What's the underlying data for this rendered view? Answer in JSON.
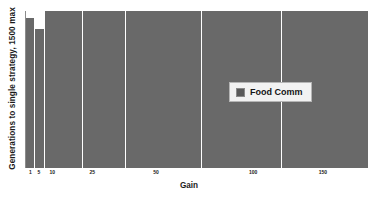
{
  "chart_data": {
    "type": "bar",
    "title": "",
    "xlabel": "Gain",
    "ylabel": "Generations to single strategy, 1500 max",
    "categories": [
      "1",
      "5",
      "10",
      "25",
      "50",
      "100",
      "150"
    ],
    "series": [
      {
        "name": "Food Comm",
        "values": [
          1440,
          1360,
          1500,
          1500,
          1500,
          1500,
          1500
        ]
      }
    ],
    "ylim": [
      0,
      1500
    ],
    "grid": false,
    "legend_position": "center-right",
    "bar_color": "#696969",
    "ticks": [
      {
        "label": "1",
        "x_frac": 0.013
      },
      {
        "label": "5",
        "x_frac": 0.038
      },
      {
        "label": "10",
        "x_frac": 0.077
      },
      {
        "label": "25",
        "x_frac": 0.194
      },
      {
        "label": "50",
        "x_frac": 0.38
      },
      {
        "label": "100",
        "x_frac": 0.664
      },
      {
        "label": "150",
        "x_frac": 0.868
      }
    ],
    "bars": [
      {
        "category": "1",
        "left_frac": 0.0,
        "width_frac": 0.022,
        "height_frac": 0.955
      },
      {
        "category": "5",
        "left_frac": 0.026,
        "width_frac": 0.026,
        "height_frac": 0.885
      },
      {
        "category": "10",
        "left_frac": 0.057,
        "width_frac": 0.106,
        "height_frac": 1.0
      },
      {
        "category": "25",
        "left_frac": 0.167,
        "width_frac": 0.122,
        "height_frac": 1.0
      },
      {
        "category": "50",
        "left_frac": 0.293,
        "width_frac": 0.218,
        "height_frac": 1.0
      },
      {
        "category": "100",
        "left_frac": 0.515,
        "width_frac": 0.23,
        "height_frac": 1.0
      },
      {
        "category": "150",
        "left_frac": 0.749,
        "width_frac": 0.251,
        "height_frac": 1.0
      }
    ]
  },
  "legend": {
    "entries": [
      {
        "label": "Food Comm",
        "color": "#595959"
      }
    ]
  },
  "axes": {
    "x_title": "Gain",
    "y_title": "Generations to single strategy, 1500 max"
  }
}
